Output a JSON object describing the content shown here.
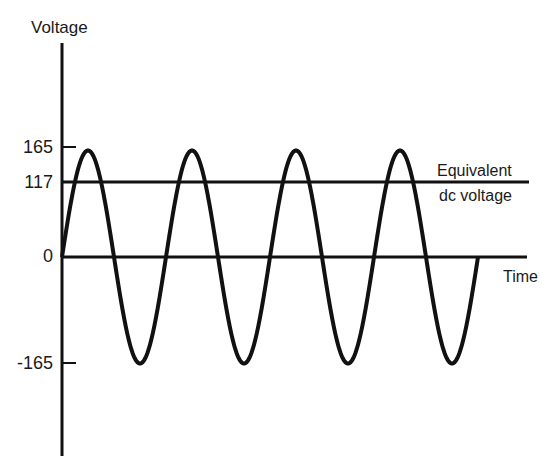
{
  "figure": {
    "y_axis_label": "Voltage",
    "x_axis_label": "Time",
    "reference_line_label_line1": "Equivalent",
    "reference_line_label_line2": "dc voltage",
    "ticks": {
      "peak": "165",
      "dc": "117",
      "zero": "0",
      "trough": "-165"
    },
    "colors": {
      "ink": "#111111",
      "background": "#ffffff"
    }
  },
  "chart_data": {
    "type": "line",
    "title": "",
    "xlabel": "Time",
    "ylabel": "Voltage",
    "yticks": [
      165,
      117,
      0,
      -165
    ],
    "ylim": [
      -165,
      165
    ],
    "series": [
      {
        "name": "AC sine voltage",
        "shape": "sine",
        "amplitude": 165,
        "cycles": 4,
        "start_phase": 0
      },
      {
        "name": "Equivalent dc voltage",
        "shape": "constant",
        "value": 117
      }
    ],
    "annotations": [
      "Equivalent dc voltage"
    ],
    "grid": false,
    "legend": "none"
  }
}
